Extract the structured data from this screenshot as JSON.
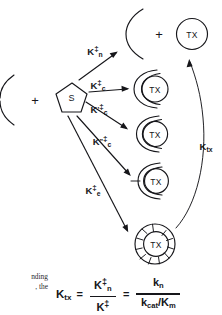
{
  "figure": {
    "kind": "reaction-scheme-diagram",
    "ink_color": "#16161a",
    "background": "#ffffff"
  },
  "reactants": {
    "enzyme_label": "",
    "plus_left": "+",
    "substrate_label": "S"
  },
  "products": {
    "plus_top": "+",
    "free_tx_label": "TX"
  },
  "complexes": [
    {
      "label": "TX",
      "form": "loose-c-shape"
    },
    {
      "label": "TX",
      "form": "partial-wrap"
    },
    {
      "label": "TX",
      "form": "tight-wrap"
    },
    {
      "label": "TX",
      "form": "segmented-closed-ring"
    }
  ],
  "rate_constants": [
    {
      "id": "kn",
      "base": "K",
      "sub": "n",
      "prime": "",
      "dagger": "‡"
    },
    {
      "id": "kc",
      "base": "K",
      "sub": "c",
      "prime": "",
      "dagger": "‡"
    },
    {
      "id": "kc1",
      "base": "K",
      "sub": "c",
      "prime": "'",
      "dagger": "‡"
    },
    {
      "id": "kc2",
      "base": "K",
      "sub": "c",
      "prime": "\"",
      "dagger": "‡"
    },
    {
      "id": "ke",
      "base": "K",
      "sub": "e",
      "prime": "",
      "dagger": "‡"
    }
  ],
  "binding_arrow": {
    "base": "K",
    "sub": "tx"
  },
  "equation": {
    "lhs_base": "K",
    "lhs_sub": "tx",
    "equals_1": "=",
    "frac1_num_base": "K",
    "frac1_num_sub": "n",
    "frac1_num_sup": "‡",
    "frac1_den_base": "K",
    "frac1_den_sub": "",
    "frac1_den_sup": "‡",
    "equals_2": "=",
    "frac2_num_base": "k",
    "frac2_num_sub": "n",
    "frac2_den": "k",
    "frac2_den_sub": "cat",
    "frac2_den_rest": "/K",
    "frac2_den_rest_sub": "m"
  },
  "caption_fragment": {
    "line1": "nding",
    "line2": ", the"
  }
}
